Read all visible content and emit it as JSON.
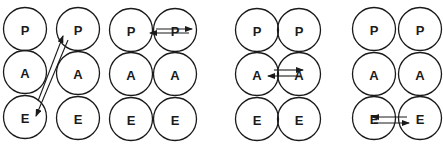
{
  "diagram": {
    "title": "",
    "state_labels": {
      "P": "P",
      "A": "A",
      "E": "E"
    },
    "panels": [
      {
        "id": "crossed-transaction",
        "columns": [
          {
            "x": 25,
            "rows": [
              {
                "label": "P",
                "y": 29
              },
              {
                "label": "A",
                "y": 72
              },
              {
                "label": "E",
                "y": 117
              }
            ]
          },
          {
            "x": 78,
            "rows": [
              {
                "label": "P",
                "y": 29
              },
              {
                "label": "A",
                "y": 73
              },
              {
                "label": "E",
                "y": 118
              }
            ]
          }
        ],
        "arrows": [
          {
            "from": [
              38,
              101
            ],
            "to": [
              63,
              36
            ]
          },
          {
            "from": [
              68,
              40
            ],
            "to": [
              36,
              116
            ]
          }
        ]
      },
      {
        "id": "parent-parent",
        "columns": [
          {
            "x": 131,
            "rows": [
              {
                "label": "P",
                "y": 30
              },
              {
                "label": "A",
                "y": 74
              },
              {
                "label": "E",
                "y": 119
              }
            ]
          },
          {
            "x": 175,
            "rows": [
              {
                "label": "P",
                "y": 30
              },
              {
                "label": "A",
                "y": 74
              },
              {
                "label": "E",
                "y": 119
              }
            ]
          }
        ],
        "arrows": [
          {
            "from": [
              156,
              29
            ],
            "to": [
              192,
              29
            ]
          },
          {
            "from": [
              189,
              33
            ],
            "to": [
              150,
              33
            ]
          }
        ]
      },
      {
        "id": "adult-adult",
        "columns": [
          {
            "x": 257,
            "rows": [
              {
                "label": "P",
                "y": 30
              },
              {
                "label": "A",
                "y": 74
              },
              {
                "label": "E",
                "y": 119
              }
            ]
          },
          {
            "x": 299,
            "rows": [
              {
                "label": "P",
                "y": 30
              },
              {
                "label": "A",
                "y": 74
              },
              {
                "label": "E",
                "y": 119
              }
            ]
          }
        ],
        "arrows": [
          {
            "from": [
              274,
              70
            ],
            "to": [
              303,
              70
            ]
          },
          {
            "from": [
              300,
              76
            ],
            "to": [
              268,
              76
            ]
          }
        ]
      },
      {
        "id": "child-child",
        "columns": [
          {
            "x": 374,
            "rows": [
              {
                "label": "P",
                "y": 29
              },
              {
                "label": "A",
                "y": 74
              },
              {
                "label": "E",
                "y": 118
              }
            ]
          },
          {
            "x": 420,
            "rows": [
              {
                "label": "P",
                "y": 29
              },
              {
                "label": "A",
                "y": 74
              },
              {
                "label": "E",
                "y": 118
              }
            ]
          }
        ],
        "arrows": [
          {
            "from": [
              407,
              117
            ],
            "to": [
              372,
              117
            ]
          },
          {
            "from": [
              374,
              123
            ],
            "to": [
              409,
              123
            ]
          }
        ]
      }
    ],
    "circle_radius": 21.5,
    "stroke_color": "#1a1a1a",
    "background": "#ffffff"
  }
}
